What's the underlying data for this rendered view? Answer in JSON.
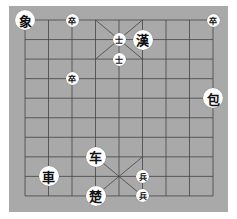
{
  "board": {
    "columns": 9,
    "rows": 10,
    "origin_x": 25,
    "origin_y": 20,
    "col_spacing": 23.5,
    "row_spacing": 19.55,
    "background_color": "#a9a9a9",
    "line_color": "#444444"
  },
  "pieces": [
    {
      "char": "象",
      "col": 0,
      "row": 0,
      "size": "large"
    },
    {
      "char": "卒",
      "col": 2,
      "row": 0,
      "size": "small"
    },
    {
      "char": "卒",
      "col": 8,
      "row": 0,
      "size": "small"
    },
    {
      "char": "士",
      "col": 4,
      "row": 1,
      "size": "small"
    },
    {
      "char": "漢",
      "col": 5,
      "row": 1,
      "size": "large"
    },
    {
      "char": "士",
      "col": 4,
      "row": 2,
      "size": "small"
    },
    {
      "char": "卒",
      "col": 2,
      "row": 3,
      "size": "small"
    },
    {
      "char": "包",
      "col": 8,
      "row": 4,
      "size": "large"
    },
    {
      "char": "车",
      "col": 3,
      "row": 7,
      "size": "large"
    },
    {
      "char": "車",
      "col": 1,
      "row": 8,
      "size": "large"
    },
    {
      "char": "兵",
      "col": 5,
      "row": 8,
      "size": "small"
    },
    {
      "char": "楚",
      "col": 3,
      "row": 9,
      "size": "large"
    },
    {
      "char": "兵",
      "col": 5,
      "row": 9,
      "size": "small"
    }
  ]
}
